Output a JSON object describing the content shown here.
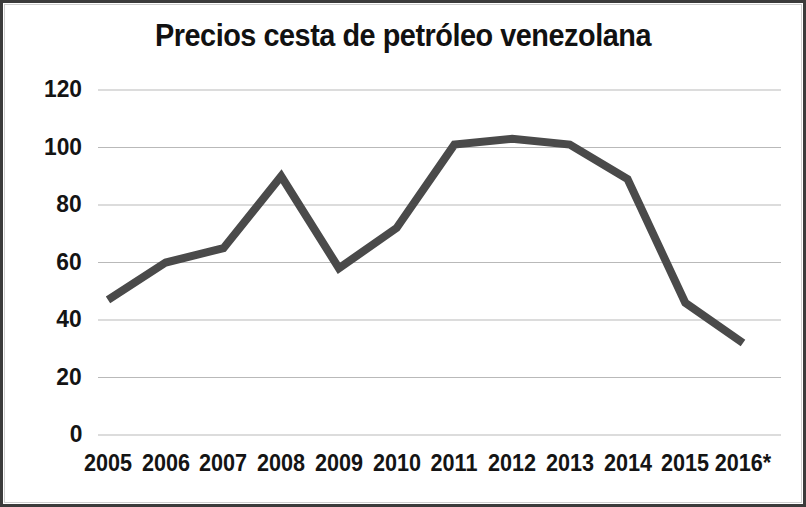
{
  "chart_data": {
    "type": "line",
    "title": "Precios cesta de petróleo venezolana",
    "subtitle": "",
    "xlabel": "",
    "ylabel": "",
    "categories": [
      "2005",
      "2006",
      "2007",
      "2008",
      "2009",
      "2010",
      "2011",
      "2012",
      "2013",
      "2014",
      "2015",
      "2016*"
    ],
    "values": [
      47,
      60,
      65,
      90,
      58,
      72,
      101,
      103,
      101,
      89,
      46,
      32
    ],
    "series": [
      {
        "name": "Precio cesta petrolera venezolana",
        "values": [
          47,
          60,
          65,
          90,
          58,
          72,
          101,
          103,
          101,
          89,
          46,
          32
        ]
      }
    ],
    "ylim": [
      0,
      120
    ],
    "yticks": [
      0,
      20,
      40,
      60,
      80,
      100,
      120
    ],
    "ytick_labels": [
      "0",
      "20",
      "40",
      "60",
      "80",
      "100",
      "120"
    ],
    "grid": true,
    "grid_axis": "y",
    "legend": false,
    "legend_position": "none",
    "line_color": "#4a4a4a",
    "line_width": 8,
    "grid_color": "#b9b9b9",
    "text_color": "#141414",
    "background": "#ffffff",
    "annotations": []
  }
}
